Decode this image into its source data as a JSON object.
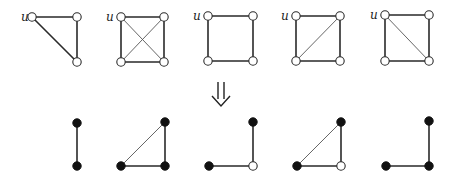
{
  "diagram": {
    "node_radius": 4.2,
    "colors": {
      "edge": "#2a2a2a",
      "thin_edge": "#555555",
      "open_node_fill": "#ffffff",
      "filled_node": "#111111"
    },
    "top_row": [
      {
        "id": "G1",
        "label": "u",
        "label_pos": [
          21,
          21
        ],
        "nodes": [
          {
            "id": "u",
            "x": 32,
            "y": 17,
            "type": "open"
          },
          {
            "id": "a",
            "x": 77,
            "y": 17,
            "type": "open"
          },
          {
            "id": "b",
            "x": 77,
            "y": 62,
            "type": "open"
          }
        ],
        "edges": [
          [
            "u",
            "a",
            "thick"
          ],
          [
            "a",
            "b",
            "thick"
          ],
          [
            "u",
            "b",
            "thick"
          ]
        ]
      },
      {
        "id": "G2",
        "label": "u",
        "label_pos": [
          106,
          21
        ],
        "nodes": [
          {
            "id": "u",
            "x": 121,
            "y": 17,
            "type": "open"
          },
          {
            "id": "a",
            "x": 164,
            "y": 17,
            "type": "open"
          },
          {
            "id": "c",
            "x": 121,
            "y": 62,
            "type": "open"
          },
          {
            "id": "b",
            "x": 164,
            "y": 62,
            "type": "open"
          }
        ],
        "edges": [
          [
            "u",
            "a",
            "thick"
          ],
          [
            "a",
            "b",
            "thick"
          ],
          [
            "b",
            "c",
            "thick"
          ],
          [
            "c",
            "u",
            "thick"
          ],
          [
            "u",
            "b",
            "thin"
          ],
          [
            "a",
            "c",
            "thin"
          ]
        ]
      },
      {
        "id": "G3",
        "label": "u",
        "label_pos": [
          193,
          20
        ],
        "nodes": [
          {
            "id": "u",
            "x": 208,
            "y": 16,
            "type": "open"
          },
          {
            "id": "a",
            "x": 253,
            "y": 16,
            "type": "open"
          },
          {
            "id": "c",
            "x": 208,
            "y": 61,
            "type": "open"
          },
          {
            "id": "b",
            "x": 253,
            "y": 61,
            "type": "open"
          }
        ],
        "edges": [
          [
            "u",
            "a",
            "thick"
          ],
          [
            "a",
            "b",
            "thick"
          ],
          [
            "b",
            "c",
            "thick"
          ],
          [
            "c",
            "u",
            "thick"
          ]
        ]
      },
      {
        "id": "G4",
        "label": "u",
        "label_pos": [
          281,
          20
        ],
        "nodes": [
          {
            "id": "u",
            "x": 296,
            "y": 16,
            "type": "open"
          },
          {
            "id": "a",
            "x": 340,
            "y": 16,
            "type": "open"
          },
          {
            "id": "c",
            "x": 296,
            "y": 61,
            "type": "open"
          },
          {
            "id": "b",
            "x": 340,
            "y": 61,
            "type": "open"
          }
        ],
        "edges": [
          [
            "u",
            "a",
            "thick"
          ],
          [
            "a",
            "b",
            "thick"
          ],
          [
            "b",
            "c",
            "thick"
          ],
          [
            "c",
            "u",
            "thick"
          ],
          [
            "c",
            "a",
            "thin"
          ]
        ]
      },
      {
        "id": "G5",
        "label": "u",
        "label_pos": [
          370,
          19
        ],
        "nodes": [
          {
            "id": "u",
            "x": 385,
            "y": 15,
            "type": "open"
          },
          {
            "id": "a",
            "x": 429,
            "y": 15,
            "type": "open"
          },
          {
            "id": "c",
            "x": 385,
            "y": 61,
            "type": "open"
          },
          {
            "id": "b",
            "x": 429,
            "y": 61,
            "type": "open"
          }
        ],
        "edges": [
          [
            "u",
            "a",
            "thick"
          ],
          [
            "a",
            "b",
            "thick"
          ],
          [
            "b",
            "c",
            "thick"
          ],
          [
            "c",
            "u",
            "thick"
          ],
          [
            "u",
            "b",
            "thin"
          ]
        ]
      }
    ],
    "arrow": {
      "symbol": "⇓",
      "x": 221,
      "y_top": 82,
      "y_bottom": 106
    },
    "bottom_row": [
      {
        "id": "H1",
        "nodes": [
          {
            "id": "a",
            "x": 77,
            "y": 123,
            "type": "filled"
          },
          {
            "id": "b",
            "x": 77,
            "y": 166,
            "type": "filled"
          }
        ],
        "edges": [
          [
            "a",
            "b",
            "thick"
          ]
        ]
      },
      {
        "id": "H2",
        "nodes": [
          {
            "id": "a",
            "x": 165,
            "y": 122,
            "type": "filled"
          },
          {
            "id": "c",
            "x": 121,
            "y": 166,
            "type": "filled"
          },
          {
            "id": "b",
            "x": 165,
            "y": 166,
            "type": "filled"
          }
        ],
        "edges": [
          [
            "a",
            "b",
            "thick"
          ],
          [
            "b",
            "c",
            "thick"
          ],
          [
            "c",
            "a",
            "thin"
          ]
        ]
      },
      {
        "id": "H3",
        "nodes": [
          {
            "id": "a",
            "x": 253,
            "y": 122,
            "type": "filled"
          },
          {
            "id": "c",
            "x": 209,
            "y": 166,
            "type": "filled"
          },
          {
            "id": "b",
            "x": 253,
            "y": 166,
            "type": "open"
          }
        ],
        "edges": [
          [
            "a",
            "b",
            "thick"
          ],
          [
            "b",
            "c",
            "thick"
          ]
        ]
      },
      {
        "id": "H4",
        "nodes": [
          {
            "id": "a",
            "x": 341,
            "y": 122,
            "type": "filled"
          },
          {
            "id": "c",
            "x": 297,
            "y": 166,
            "type": "filled"
          },
          {
            "id": "b",
            "x": 341,
            "y": 166,
            "type": "open"
          }
        ],
        "edges": [
          [
            "a",
            "b",
            "thick"
          ],
          [
            "b",
            "c",
            "thick"
          ],
          [
            "c",
            "a",
            "thin"
          ]
        ]
      },
      {
        "id": "H5",
        "nodes": [
          {
            "id": "a",
            "x": 429,
            "y": 121,
            "type": "filled"
          },
          {
            "id": "c",
            "x": 386,
            "y": 166,
            "type": "filled"
          },
          {
            "id": "b",
            "x": 429,
            "y": 166,
            "type": "filled"
          }
        ],
        "edges": [
          [
            "a",
            "b",
            "thick"
          ],
          [
            "b",
            "c",
            "thick"
          ]
        ]
      }
    ]
  }
}
